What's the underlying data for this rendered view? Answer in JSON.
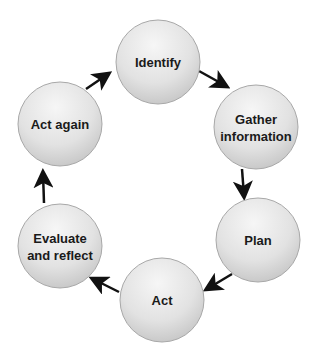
{
  "diagram": {
    "type": "cycle",
    "colors": {
      "node_fill_light": "#f4f4f4",
      "node_fill_dark": "#c9c9c9",
      "node_stroke": "#a8a8a8",
      "arrow": "#111111",
      "text": "#1a1a1a"
    },
    "nodes": [
      {
        "id": "identify",
        "lines": [
          "Identify"
        ],
        "cx": 158,
        "cy": 62
      },
      {
        "id": "gather",
        "lines": [
          "Gather",
          "information"
        ],
        "cx": 256,
        "cy": 127
      },
      {
        "id": "plan",
        "lines": [
          "Plan"
        ],
        "cx": 258,
        "cy": 240
      },
      {
        "id": "act",
        "lines": [
          "Act"
        ],
        "cx": 162,
        "cy": 300
      },
      {
        "id": "evaluate",
        "lines": [
          "Evaluate",
          "and reflect"
        ],
        "cx": 60,
        "cy": 246
      },
      {
        "id": "act-again",
        "lines": [
          "Act again"
        ],
        "cx": 60,
        "cy": 124
      }
    ],
    "edges": [
      {
        "from": "identify",
        "to": "gather"
      },
      {
        "from": "gather",
        "to": "plan"
      },
      {
        "from": "plan",
        "to": "act"
      },
      {
        "from": "act",
        "to": "evaluate"
      },
      {
        "from": "evaluate",
        "to": "act-again"
      },
      {
        "from": "act-again",
        "to": "identify"
      }
    ]
  }
}
